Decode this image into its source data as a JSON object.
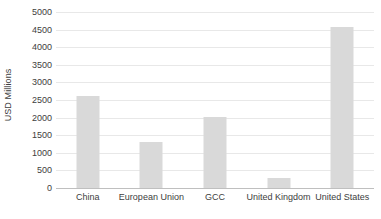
{
  "chart_data": {
    "type": "bar",
    "title": "",
    "subtitle": "",
    "xlabel": "",
    "ylabel": "USD Millions",
    "categories": [
      "China",
      "European Union",
      "GCC",
      "United Kingdom",
      "United States"
    ],
    "values": [
      2620,
      1300,
      2020,
      290,
      4580
    ],
    "ylim": [
      0,
      5000
    ],
    "ytick_labels": [
      "5000",
      "4500",
      "4000",
      "3500",
      "3000",
      "2500",
      "2000",
      "1500",
      "1000",
      "500",
      "0"
    ],
    "ytick_values": [
      5000,
      4500,
      4000,
      3500,
      3000,
      2500,
      2000,
      1500,
      1000,
      500,
      0
    ],
    "grid": true,
    "legend": false,
    "legend_position": "none",
    "bar_color": "#d9d9d9",
    "gridline_color": "#e8e8e8",
    "axis_color": "#bfbfbf",
    "text_color": "#404040",
    "background_color": "#ffffff"
  }
}
